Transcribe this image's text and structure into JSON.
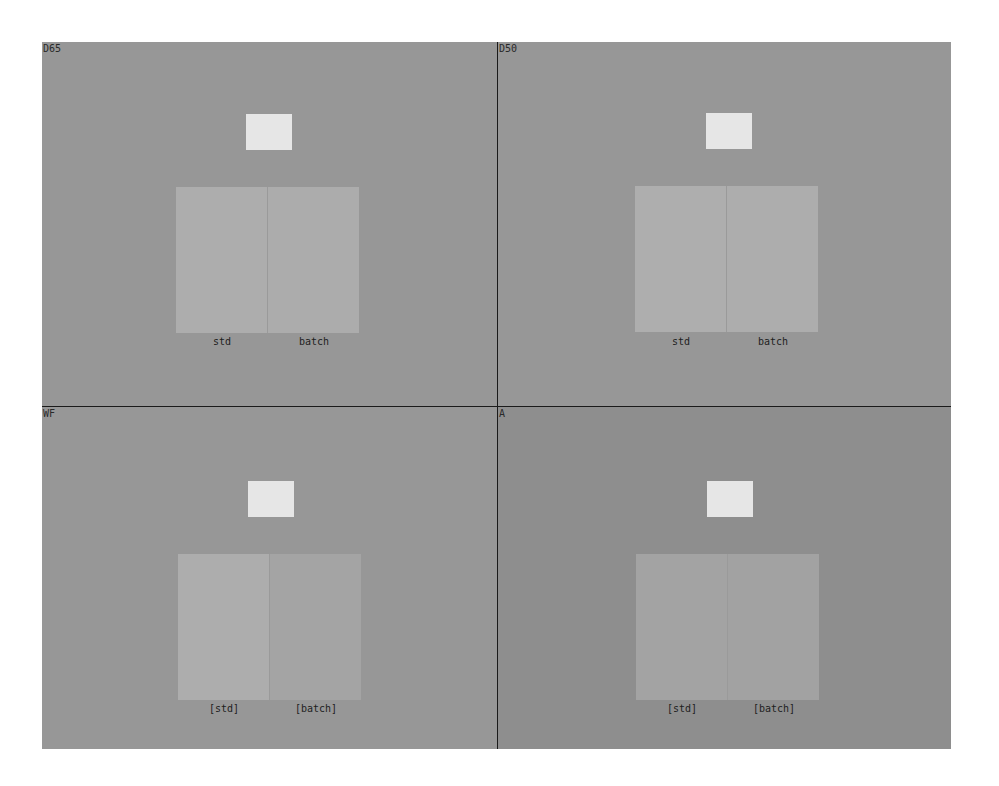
{
  "viewer": {
    "title": "Illuminant comparison viewer",
    "panels": [
      {
        "id": "d65",
        "label": "D65",
        "background": "#979797",
        "std_color": "#adadad",
        "batch_color": "#acacac",
        "std_caption": "std",
        "batch_caption": "batch"
      },
      {
        "id": "d50",
        "label": "D50",
        "background": "#979797",
        "std_color": "#aeaeae",
        "batch_color": "#adadad",
        "std_caption": "std",
        "batch_caption": "batch"
      },
      {
        "id": "wf",
        "label": "WF",
        "background": "#979797",
        "std_color": "#adadad",
        "batch_color": "#a4a4a4",
        "std_caption": "[std]",
        "batch_caption": "[batch]"
      },
      {
        "id": "a",
        "label": "A",
        "background": "#8e8e8e",
        "std_color": "#a3a3a3",
        "batch_color": "#a2a2a2",
        "std_caption": "[std]",
        "batch_caption": "[batch]"
      }
    ],
    "reference_white": "#e6e6e6",
    "divider_color": "#1a1a1a"
  }
}
